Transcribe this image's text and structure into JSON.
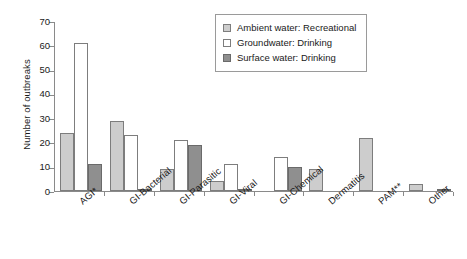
{
  "chart_data": {
    "type": "bar",
    "title": "",
    "xlabel": "",
    "ylabel": "Number of outbreaks",
    "ylim": [
      0,
      70
    ],
    "yticks": [
      0,
      10,
      20,
      30,
      40,
      50,
      60,
      70
    ],
    "grid": false,
    "legend_position": "top-right",
    "categories": [
      "AGI*",
      "GI-Bacterial",
      "GI-Parasitic",
      "GI-Viral",
      "GI-Chemical",
      "Dermatitis",
      "PAM**",
      "Other"
    ],
    "series": [
      {
        "name": "Ambient water: Recreational",
        "color": "#cdcdcd",
        "values": [
          24,
          29,
          9,
          4,
          0,
          9,
          22,
          3
        ]
      },
      {
        "name": "Groundwater: Drinking",
        "color": "#ffffff",
        "values": [
          61,
          23,
          21,
          11,
          14,
          0,
          0,
          0
        ]
      },
      {
        "name": "Surface water: Drinking",
        "color": "#8f8f8f",
        "values": [
          11,
          1,
          19,
          1,
          10,
          0,
          0,
          1
        ]
      }
    ]
  },
  "legend": {
    "items": [
      {
        "label": "Ambient water: Recreational",
        "swatch": "amb"
      },
      {
        "label": "Groundwater: Drinking",
        "swatch": "gw"
      },
      {
        "label": "Surface water: Drinking",
        "swatch": "sw"
      }
    ]
  },
  "axis": {
    "y_title": "Number of outbreaks",
    "y_tick_labels": [
      "0",
      "10",
      "20",
      "30",
      "40",
      "50",
      "60",
      "70"
    ],
    "x_tick_labels": [
      "AGI*",
      "GI-Bacterial",
      "GI-Parasitic",
      "GI-Viral",
      "GI-Chemical",
      "Dermatitis",
      "PAM**",
      "Other"
    ]
  }
}
